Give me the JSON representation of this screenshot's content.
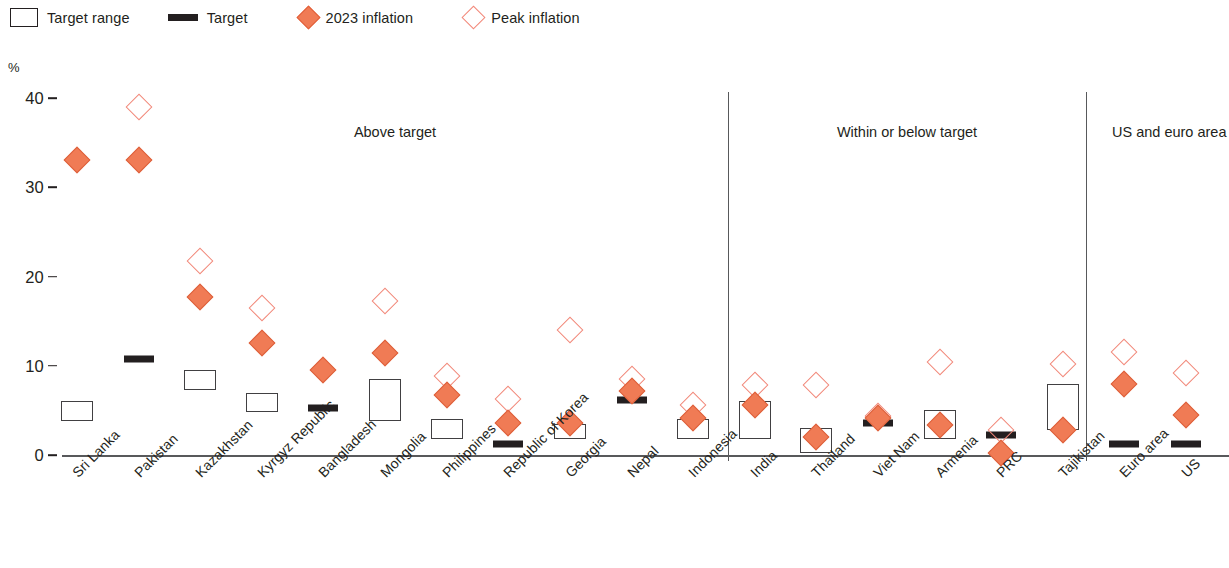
{
  "legend": {
    "items": [
      {
        "label": "Target range",
        "symbol": "range-box-icon"
      },
      {
        "label": "Target",
        "symbol": "target-bar-icon"
      },
      {
        "label": "2023 inflation",
        "symbol": "filled-diamond-icon"
      },
      {
        "label": "Peak inflation",
        "symbol": "open-diamond-icon"
      }
    ]
  },
  "colors": {
    "inflation_2023": "#F07B55",
    "peak_inflation": "#F2887A",
    "target": "#231f20",
    "range_border": "#414042",
    "axis": "#58595b"
  },
  "axis": {
    "y_unit": "%",
    "y_ticks": [
      "0",
      "10",
      "20",
      "30",
      "40"
    ]
  },
  "sections": [
    {
      "label": "Above target",
      "start": 0,
      "end": 10
    },
    {
      "label": "Within or below target",
      "start": 11,
      "end": 16
    },
    {
      "label": "US and euro area",
      "start": 17,
      "end": 18
    }
  ],
  "chart_data": {
    "type": "scatter",
    "title": "",
    "xlabel": "",
    "ylabel": "%",
    "ylim": [
      0,
      40
    ],
    "yticks": [
      0,
      10,
      20,
      30,
      40
    ],
    "grid": false,
    "legend_position": "top-left",
    "categories": [
      "Sri Lanka",
      "Pakistan",
      "Kazakhstan",
      "Kyrgyz Republic",
      "Bangladesh",
      "Mongolia",
      "Philippines",
      "Republic of Korea",
      "Georgia",
      "Nepal",
      "Indonesia",
      "India",
      "Thailand",
      "Viet Nam",
      "Armenia",
      "PRC",
      "Tajikistan",
      "Euro area",
      "US"
    ],
    "series": [
      {
        "name": "2023 inflation",
        "type": "marker-filled-diamond",
        "values": [
          33.0,
          33.0,
          17.7,
          12.5,
          9.5,
          11.4,
          6.7,
          3.6,
          3.6,
          7.2,
          4.1,
          5.6,
          2.0,
          4.2,
          3.4,
          0.2,
          2.8,
          8.0,
          4.5
        ]
      },
      {
        "name": "Peak inflation",
        "type": "marker-open-diamond",
        "values": [
          null,
          39.0,
          21.7,
          16.5,
          null,
          17.3,
          8.9,
          6.3,
          14.0,
          8.5,
          5.6,
          7.8,
          7.8,
          4.4,
          10.4,
          2.8,
          10.2,
          11.5,
          9.2
        ]
      },
      {
        "name": "Target",
        "type": "bar-marker",
        "values": [
          null,
          11.5,
          null,
          null,
          6.0,
          null,
          null,
          2.0,
          null,
          7.0,
          null,
          null,
          null,
          4.4,
          null,
          3.0,
          null,
          2.0,
          2.0
        ]
      },
      {
        "name": "Target range",
        "type": "range-box",
        "values": [
          [
            4.0,
            6.0
          ],
          null,
          [
            7.5,
            9.5
          ],
          [
            5.0,
            7.0
          ],
          null,
          [
            4.0,
            8.5
          ],
          [
            2.0,
            4.0
          ],
          null,
          [
            2.0,
            3.5
          ],
          null,
          [
            2.0,
            4.0
          ],
          [
            2.0,
            6.0
          ],
          [
            0.5,
            3.0
          ],
          null,
          [
            2.0,
            5.0
          ],
          null,
          [
            3.0,
            8.0
          ],
          null,
          null
        ]
      }
    ]
  }
}
